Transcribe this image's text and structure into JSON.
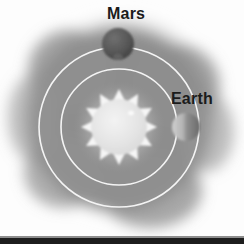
{
  "figure": {
    "background_color": "#fcfcfc",
    "nebula_color": "#8e8e8e",
    "orbit_color": "#f2f2f2",
    "bottom_band_color": "#1d1d1d"
  },
  "labels": {
    "mars": "Mars",
    "earth": "Earth"
  },
  "chart_data": {
    "type": "scatter",
    "xlabel": "",
    "ylabel": "",
    "grid": false,
    "legend": "none",
    "center": {
      "x": 119,
      "y": 127
    },
    "bodies": [
      {
        "name": "Sun",
        "label": "",
        "kind": "star",
        "cx": 119,
        "cy": 127,
        "radius": 28,
        "spike_count": 12,
        "spike_length": 10,
        "color": "#e8e8e8",
        "edge_color": "#f6f6f6"
      },
      {
        "name": "Earth",
        "label": "Earth",
        "kind": "planet",
        "cx": 186,
        "cy": 127,
        "radius": 14,
        "orbit": "inner",
        "light_color": "#bdbdbd",
        "dark_color": "#6f6f6f"
      },
      {
        "name": "Mars",
        "label": "Mars",
        "kind": "planet",
        "cx": 118,
        "cy": 44,
        "radius": 16,
        "orbit": "outer",
        "light_color": "#6b6b6b",
        "dark_color": "#4a4a4a"
      }
    ],
    "orbits": [
      {
        "name": "inner",
        "body": "Earth",
        "cx": 119,
        "cy": 127,
        "radius": 58,
        "stroke_width": 1.6,
        "color": "#f4f4f4"
      },
      {
        "name": "outer",
        "body": "Mars",
        "cx": 119,
        "cy": 127,
        "radius": 80,
        "stroke_width": 1.6,
        "color": "#f4f4f4"
      }
    ]
  }
}
